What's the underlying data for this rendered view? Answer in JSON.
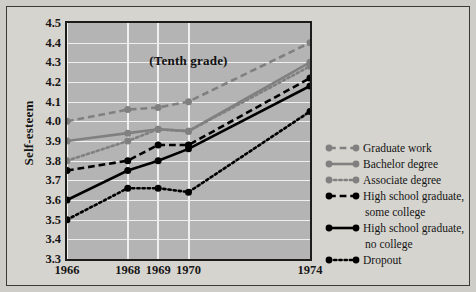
{
  "chart_data": {
    "type": "line",
    "title": "(Tenth grade)",
    "xlabel": "",
    "ylabel": "Self-esteem",
    "x": [
      1966,
      1968,
      1969,
      1970,
      1974
    ],
    "categories": [
      "1966",
      "1968",
      "1969",
      "1970",
      "1974"
    ],
    "ylim": [
      3.3,
      4.5
    ],
    "ytick_step": 0.1,
    "yticks": [
      "4.5",
      "4.4",
      "4.3",
      "4.2",
      "4.1",
      "4.0",
      "3.9",
      "3.8",
      "3.7",
      "3.6",
      "3.5",
      "3.4",
      "3.3"
    ],
    "grid": "horizontal-and-vertical",
    "legend_position": "right",
    "plot_background": "#b4b4b4",
    "figure_background": "#d6d4cf",
    "series": [
      {
        "name": "Graduate work",
        "color": "#808080",
        "style": "dashed",
        "values": [
          4.0,
          4.06,
          4.07,
          4.1,
          4.4
        ]
      },
      {
        "name": "Bachelor degree",
        "color": "#808080",
        "style": "solid",
        "values": [
          3.9,
          3.94,
          3.96,
          3.95,
          4.3
        ]
      },
      {
        "name": "Associate degree",
        "color": "#808080",
        "style": "dotted",
        "values": [
          3.8,
          3.9,
          3.96,
          3.95,
          4.28
        ]
      },
      {
        "name": "High school graduate, some college",
        "label_line1": "High school graduate,",
        "label_line2": "some college",
        "color": "#000000",
        "style": "dashed",
        "values": [
          3.75,
          3.8,
          3.88,
          3.88,
          4.22
        ]
      },
      {
        "name": "High school graduate, no college",
        "label_line1": "High school graduate,",
        "label_line2": "no college",
        "color": "#000000",
        "style": "solid",
        "values": [
          3.6,
          3.75,
          3.8,
          3.86,
          4.18
        ]
      },
      {
        "name": "Dropout",
        "color": "#000000",
        "style": "dotted",
        "values": [
          3.5,
          3.66,
          3.66,
          3.64,
          4.05
        ]
      }
    ]
  },
  "legend": {
    "items": [
      {
        "label": "Graduate work"
      },
      {
        "label": "Bachelor degree"
      },
      {
        "label": "Associate degree"
      },
      {
        "label": "High school graduate,"
      },
      {
        "label": "some college"
      },
      {
        "label": "High school graduate,"
      },
      {
        "label": "no college"
      },
      {
        "label": "Dropout"
      }
    ]
  }
}
